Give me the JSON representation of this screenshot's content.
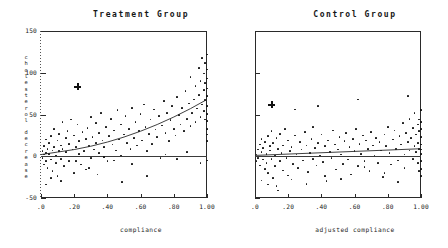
{
  "chart_data": [
    {
      "type": "scatter",
      "title": "Treatment Group",
      "xlabel": "compliance",
      "ylabel": "cholesterol decrease",
      "ylabel_lines": [
        "cholesterol",
        "decrease"
      ],
      "xlim": [
        0,
        1
      ],
      "ylim": [
        -50,
        150
      ],
      "xticks": [
        0,
        0.2,
        0.4,
        0.6,
        0.8,
        1.0
      ],
      "xticklabels": [
        ".0",
        ".20",
        ".40",
        ".60",
        ".80",
        "1.00"
      ],
      "yticks": [
        -50,
        0,
        50,
        100,
        150
      ],
      "yticklabels": [
        "-50",
        "0",
        "50",
        "100",
        "150"
      ],
      "grid": false,
      "legend": "none",
      "reference_line": {
        "y": 0,
        "label": "zero decrease"
      },
      "fit_curve": {
        "kind": "quadratic",
        "x": [
          0.0,
          0.1,
          0.2,
          0.3,
          0.4,
          0.5,
          0.6,
          0.7,
          0.8,
          0.9,
          1.0
        ],
        "y": [
          2,
          5,
          8,
          12,
          17,
          23,
          30,
          38,
          47,
          57,
          68
        ]
      },
      "special_marker": {
        "symbol": "+",
        "x": 0.22,
        "y": 83
      },
      "points": [
        [
          0.01,
          -2
        ],
        [
          0.01,
          6
        ],
        [
          0.02,
          2
        ],
        [
          0.02,
          -10
        ],
        [
          0.02,
          12
        ],
        [
          0.03,
          4
        ],
        [
          0.03,
          -6
        ],
        [
          0.03,
          20
        ],
        [
          0.04,
          9
        ],
        [
          0.04,
          -14
        ],
        [
          0.05,
          3
        ],
        [
          0.05,
          16
        ],
        [
          0.06,
          -4
        ],
        [
          0.06,
          24
        ],
        [
          0.07,
          7
        ],
        [
          0.07,
          -18
        ],
        [
          0.08,
          11
        ],
        [
          0.08,
          33
        ],
        [
          0.09,
          1
        ],
        [
          0.09,
          -8
        ],
        [
          0.1,
          19
        ],
        [
          0.1,
          -24
        ],
        [
          0.11,
          6
        ],
        [
          0.11,
          27
        ],
        [
          0.12,
          13
        ],
        [
          0.12,
          -3
        ],
        [
          0.13,
          41
        ],
        [
          0.13,
          9
        ],
        [
          0.14,
          -12
        ],
        [
          0.15,
          22
        ],
        [
          0.15,
          5
        ],
        [
          0.16,
          30
        ],
        [
          0.17,
          -6
        ],
        [
          0.17,
          15
        ],
        [
          0.18,
          44
        ],
        [
          0.19,
          8
        ],
        [
          0.2,
          -20
        ],
        [
          0.2,
          25
        ],
        [
          0.21,
          11
        ],
        [
          0.22,
          38
        ],
        [
          0.23,
          3
        ],
        [
          0.23,
          18
        ],
        [
          0.24,
          -10
        ],
        [
          0.25,
          29
        ],
        [
          0.26,
          6
        ],
        [
          0.27,
          21
        ],
        [
          0.27,
          -16
        ],
        [
          0.28,
          34
        ],
        [
          0.29,
          12
        ],
        [
          0.3,
          47
        ],
        [
          0.3,
          -2
        ],
        [
          0.31,
          23
        ],
        [
          0.32,
          8
        ],
        [
          0.33,
          40
        ],
        [
          0.33,
          16
        ],
        [
          0.34,
          -22
        ],
        [
          0.35,
          28
        ],
        [
          0.35,
          4
        ],
        [
          0.36,
          52
        ],
        [
          0.37,
          19
        ],
        [
          0.38,
          11
        ],
        [
          0.39,
          35
        ],
        [
          0.4,
          -6
        ],
        [
          0.41,
          24
        ],
        [
          0.42,
          45
        ],
        [
          0.43,
          14
        ],
        [
          0.44,
          31
        ],
        [
          0.45,
          7
        ],
        [
          0.46,
          55
        ],
        [
          0.47,
          20
        ],
        [
          0.48,
          38
        ],
        [
          0.49,
          -31
        ],
        [
          0.5,
          26
        ],
        [
          0.51,
          48
        ],
        [
          0.52,
          16
        ],
        [
          0.53,
          33
        ],
        [
          0.54,
          9
        ],
        [
          0.55,
          58
        ],
        [
          0.56,
          22
        ],
        [
          0.57,
          41
        ],
        [
          0.58,
          13
        ],
        [
          0.59,
          30
        ],
        [
          0.6,
          51
        ],
        [
          0.61,
          19
        ],
        [
          0.62,
          62
        ],
        [
          0.63,
          35
        ],
        [
          0.64,
          -24
        ],
        [
          0.65,
          27
        ],
        [
          0.66,
          44
        ],
        [
          0.67,
          15
        ],
        [
          0.68,
          56
        ],
        [
          0.69,
          32
        ],
        [
          0.7,
          23
        ],
        [
          0.71,
          48
        ],
        [
          0.72,
          -2
        ],
        [
          0.73,
          37
        ],
        [
          0.74,
          66
        ],
        [
          0.75,
          28
        ],
        [
          0.76,
          52
        ],
        [
          0.77,
          18
        ],
        [
          0.78,
          43
        ],
        [
          0.79,
          60
        ],
        [
          0.8,
          33
        ],
        [
          0.81,
          25
        ],
        [
          0.82,
          71
        ],
        [
          0.83,
          49
        ],
        [
          0.84,
          38
        ],
        [
          0.85,
          58
        ],
        [
          0.86,
          30
        ],
        [
          0.87,
          78
        ],
        [
          0.88,
          45
        ],
        [
          0.89,
          63
        ],
        [
          0.9,
          36
        ],
        [
          0.9,
          95
        ],
        [
          0.91,
          52
        ],
        [
          0.92,
          68
        ],
        [
          0.93,
          41
        ],
        [
          0.93,
          84
        ],
        [
          0.94,
          57
        ],
        [
          0.95,
          73
        ],
        [
          0.95,
          106
        ],
        [
          0.96,
          47
        ],
        [
          0.96,
          90
        ],
        [
          0.97,
          62
        ],
        [
          0.97,
          118
        ],
        [
          0.98,
          54
        ],
        [
          0.98,
          79
        ],
        [
          0.98,
          99
        ],
        [
          0.99,
          44
        ],
        [
          0.99,
          67
        ],
        [
          0.99,
          88
        ],
        [
          0.99,
          112
        ],
        [
          1.0,
          33
        ],
        [
          1.0,
          51
        ],
        [
          1.0,
          60
        ],
        [
          1.0,
          72
        ],
        [
          1.0,
          81
        ],
        [
          1.0,
          93
        ],
        [
          1.0,
          104
        ],
        [
          1.0,
          122
        ],
        [
          1.0,
          -5
        ],
        [
          1.0,
          18
        ],
        [
          1.0,
          26
        ],
        [
          1.0,
          42
        ],
        [
          0.96,
          -8
        ],
        [
          0.88,
          5
        ],
        [
          0.82,
          -3
        ],
        [
          0.75,
          2
        ],
        [
          0.64,
          6
        ],
        [
          0.55,
          -9
        ],
        [
          0.48,
          1
        ],
        [
          0.44,
          -5
        ],
        [
          0.38,
          -1
        ],
        [
          0.29,
          -14
        ],
        [
          0.21,
          -6
        ],
        [
          0.12,
          -30
        ],
        [
          0.06,
          -26
        ],
        [
          0.03,
          -34
        ]
      ]
    },
    {
      "type": "scatter",
      "title": "Control Group",
      "xlabel": "adjusted compliance",
      "ylabel": "cholesterol decrease",
      "xlim": [
        0,
        1
      ],
      "ylim": [
        -50,
        150
      ],
      "xticks": [
        0,
        0.2,
        0.4,
        0.6,
        0.8,
        1.0
      ],
      "xticklabels": [
        ".0",
        ".20",
        ".40",
        ".60",
        ".80",
        "1.00"
      ],
      "yticks": [
        -50,
        0,
        50,
        100,
        150
      ],
      "grid": false,
      "legend": "none",
      "reference_line": {
        "y": 0,
        "label": "zero decrease"
      },
      "fit_curve": {
        "kind": "linear",
        "x": [
          0.0,
          0.5,
          1.0
        ],
        "y": [
          1,
          5,
          9
        ]
      },
      "special_marker": {
        "symbol": "+",
        "x": 0.1,
        "y": 62
      },
      "points": [
        [
          0.01,
          2
        ],
        [
          0.01,
          -6
        ],
        [
          0.02,
          8
        ],
        [
          0.02,
          -2
        ],
        [
          0.03,
          14
        ],
        [
          0.03,
          -11
        ],
        [
          0.04,
          5
        ],
        [
          0.04,
          21
        ],
        [
          0.05,
          -4
        ],
        [
          0.05,
          10
        ],
        [
          0.06,
          -15
        ],
        [
          0.06,
          17
        ],
        [
          0.07,
          3
        ],
        [
          0.07,
          -8
        ],
        [
          0.08,
          24
        ],
        [
          0.08,
          -20
        ],
        [
          0.09,
          7
        ],
        [
          0.09,
          12
        ],
        [
          0.1,
          -3
        ],
        [
          0.1,
          30
        ],
        [
          0.11,
          -26
        ],
        [
          0.11,
          16
        ],
        [
          0.12,
          1
        ],
        [
          0.12,
          -12
        ],
        [
          0.13,
          22
        ],
        [
          0.13,
          -36
        ],
        [
          0.14,
          9
        ],
        [
          0.15,
          -6
        ],
        [
          0.15,
          27
        ],
        [
          0.16,
          4
        ],
        [
          0.17,
          -17
        ],
        [
          0.17,
          13
        ],
        [
          0.18,
          33
        ],
        [
          0.19,
          -2
        ],
        [
          0.2,
          19
        ],
        [
          0.2,
          -23
        ],
        [
          0.21,
          6
        ],
        [
          0.22,
          11
        ],
        [
          0.23,
          -9
        ],
        [
          0.24,
          25
        ],
        [
          0.25,
          2
        ],
        [
          0.26,
          -14
        ],
        [
          0.27,
          17
        ],
        [
          0.28,
          8
        ],
        [
          0.29,
          -5
        ],
        [
          0.3,
          29
        ],
        [
          0.31,
          13
        ],
        [
          0.32,
          -19
        ],
        [
          0.33,
          4
        ],
        [
          0.34,
          21
        ],
        [
          0.35,
          -3
        ],
        [
          0.35,
          35
        ],
        [
          0.36,
          10
        ],
        [
          0.37,
          -11
        ],
        [
          0.38,
          16
        ],
        [
          0.39,
          1
        ],
        [
          0.4,
          26
        ],
        [
          0.41,
          -7
        ],
        [
          0.42,
          12
        ],
        [
          0.43,
          -30
        ],
        [
          0.44,
          19
        ],
        [
          0.45,
          5
        ],
        [
          0.46,
          -2
        ],
        [
          0.47,
          31
        ],
        [
          0.48,
          14
        ],
        [
          0.49,
          -16
        ],
        [
          0.5,
          8
        ],
        [
          0.51,
          23
        ],
        [
          0.52,
          2
        ],
        [
          0.53,
          -9
        ],
        [
          0.54,
          18
        ],
        [
          0.55,
          28
        ],
        [
          0.56,
          -4
        ],
        [
          0.57,
          11
        ],
        [
          0.58,
          -22
        ],
        [
          0.59,
          21
        ],
        [
          0.6,
          6
        ],
        [
          0.61,
          33
        ],
        [
          0.62,
          -12
        ],
        [
          0.63,
          15
        ],
        [
          0.64,
          3
        ],
        [
          0.65,
          25
        ],
        [
          0.66,
          -6
        ],
        [
          0.67,
          19
        ],
        [
          0.68,
          9
        ],
        [
          0.69,
          -18
        ],
        [
          0.7,
          29
        ],
        [
          0.71,
          13
        ],
        [
          0.72,
          1
        ],
        [
          0.73,
          22
        ],
        [
          0.74,
          -8
        ],
        [
          0.75,
          17
        ],
        [
          0.76,
          7
        ],
        [
          0.77,
          -25
        ],
        [
          0.78,
          26
        ],
        [
          0.79,
          12
        ],
        [
          0.8,
          35
        ],
        [
          0.81,
          4
        ],
        [
          0.82,
          -10
        ],
        [
          0.83,
          20
        ],
        [
          0.84,
          31
        ],
        [
          0.85,
          9
        ],
        [
          0.86,
          -5
        ],
        [
          0.87,
          24
        ],
        [
          0.88,
          14
        ],
        [
          0.89,
          40
        ],
        [
          0.9,
          2
        ],
        [
          0.9,
          -14
        ],
        [
          0.91,
          28
        ],
        [
          0.92,
          17
        ],
        [
          0.93,
          7
        ],
        [
          0.93,
          45
        ],
        [
          0.94,
          22
        ],
        [
          0.95,
          -3
        ],
        [
          0.95,
          34
        ],
        [
          0.96,
          12
        ],
        [
          0.96,
          52
        ],
        [
          0.97,
          26
        ],
        [
          0.97,
          5
        ],
        [
          0.98,
          38
        ],
        [
          0.98,
          16
        ],
        [
          0.98,
          -8
        ],
        [
          0.99,
          30
        ],
        [
          0.99,
          9
        ],
        [
          0.99,
          44
        ],
        [
          0.99,
          -18
        ],
        [
          1.0,
          3
        ],
        [
          1.0,
          14
        ],
        [
          1.0,
          23
        ],
        [
          1.0,
          33
        ],
        [
          1.0,
          41
        ],
        [
          1.0,
          55
        ],
        [
          1.0,
          -6
        ],
        [
          1.0,
          -15
        ],
        [
          1.0,
          -24
        ],
        [
          1.0,
          8
        ],
        [
          0.86,
          -31
        ],
        [
          0.78,
          -20
        ],
        [
          0.66,
          -13
        ],
        [
          0.52,
          -27
        ],
        [
          0.42,
          -24
        ],
        [
          0.31,
          -33
        ],
        [
          0.22,
          -28
        ],
        [
          0.14,
          -41
        ],
        [
          0.08,
          -34
        ],
        [
          0.04,
          -29
        ],
        [
          0.62,
          68
        ],
        [
          0.38,
          60
        ],
        [
          0.24,
          56
        ],
        [
          0.92,
          72
        ]
      ]
    }
  ]
}
